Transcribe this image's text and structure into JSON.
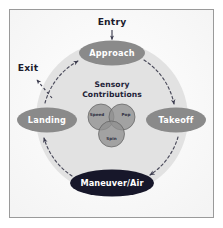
{
  "figure": {
    "frame_border_color": "#9a9a9a",
    "background_color": "#ffffff",
    "panel_color": "#fdfdfd"
  },
  "cycle": {
    "background_circle_color": "#e2e2e2",
    "arrow_color": "#4a4a5a",
    "path_style": "dashed",
    "direction": "clockwise",
    "nodes": [
      {
        "id": "approach",
        "label": "Approach",
        "fill": "#8a8a8a",
        "text_color": "#ffffff",
        "cx": 112,
        "cy": 53,
        "rx": 33,
        "ry": 12.5
      },
      {
        "id": "takeoff",
        "label": "Takeoff",
        "fill": "#8a8a8a",
        "text_color": "#ffffff",
        "cx": 176,
        "cy": 120,
        "rx": 30,
        "ry": 12.5
      },
      {
        "id": "maneuver-air",
        "label": "Maneuver/Air",
        "fill": "#17172a",
        "text_color": "#ffffff",
        "cx": 112,
        "cy": 183,
        "rx": 42,
        "ry": 13.5
      },
      {
        "id": "landing",
        "label": "Landing",
        "fill": "#8a8a8a",
        "text_color": "#ffffff",
        "cx": 47,
        "cy": 120,
        "rx": 30,
        "ry": 12.5
      }
    ]
  },
  "entry": {
    "label": "Entry",
    "text_color": "#1c1c2e",
    "arrow_direction": "down"
  },
  "exit": {
    "label": "Exit",
    "text_color": "#1c1c2e",
    "arrow_direction": "up-left"
  },
  "sensory": {
    "title_line1": "Sensory",
    "title_line2": "Contributions",
    "title_color": "#232338",
    "venn": {
      "fill": "#8f8f8f",
      "stroke": "#5e5e5e",
      "label_color": "#2c2c3e",
      "circles": [
        {
          "id": "speed",
          "label": "Speed",
          "cx": 101,
          "cy": 117,
          "r": 13
        },
        {
          "id": "pop",
          "label": "Pop",
          "cx": 122,
          "cy": 117,
          "r": 13
        },
        {
          "id": "spin",
          "label": "Spin",
          "cx": 111.5,
          "cy": 134,
          "r": 13
        }
      ]
    }
  }
}
